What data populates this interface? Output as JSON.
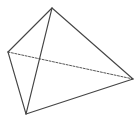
{
  "diagram": {
    "type": "tetrahedron",
    "stroke_color": "#444444",
    "background": "#ffffff",
    "vertices": {
      "apex": [
        52,
        8
      ],
      "left": [
        8,
        52
      ],
      "right": [
        133,
        79
      ],
      "bottom": [
        26,
        114
      ]
    },
    "edges": [
      {
        "from": "apex",
        "to": "left",
        "style": "solid"
      },
      {
        "from": "apex",
        "to": "bottom",
        "style": "solid"
      },
      {
        "from": "apex",
        "to": "right",
        "style": "solid"
      },
      {
        "from": "left",
        "to": "bottom",
        "style": "solid"
      },
      {
        "from": "bottom",
        "to": "right",
        "style": "solid"
      },
      {
        "from": "left",
        "to": "right",
        "style": "dashed"
      }
    ]
  }
}
